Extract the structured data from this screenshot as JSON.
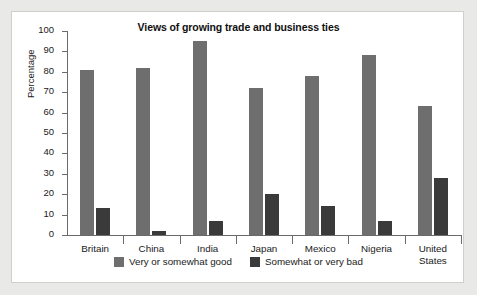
{
  "chart_data": {
    "type": "bar",
    "title": "Views of growing trade and business ties",
    "xlabel": "",
    "ylabel": "Percentage",
    "ylim": [
      0,
      100
    ],
    "yticks": [
      0,
      10,
      20,
      30,
      40,
      50,
      60,
      70,
      80,
      90,
      100
    ],
    "grid": false,
    "legend_position": "bottom",
    "categories": [
      "Britain",
      "China",
      "India",
      "Japan",
      "Mexico",
      "Nigeria",
      "United\nStates"
    ],
    "series": [
      {
        "name": "Very or somewhat good",
        "color": "#6e6e6e",
        "values": [
          81,
          82,
          95,
          72,
          78,
          88,
          63
        ]
      },
      {
        "name": "Somewhat or very bad",
        "color": "#3a3a3a",
        "values": [
          13,
          2,
          7,
          20,
          14,
          7,
          28
        ]
      }
    ]
  },
  "legend": {
    "items": [
      {
        "label": "Very or somewhat good",
        "swatch": "good"
      },
      {
        "label": "Somewhat or very bad",
        "swatch": "bad"
      }
    ]
  },
  "colors": {
    "page_background": "#e9e9e7",
    "panel_background": "#ffffff",
    "panel_border": "#cfcfcd",
    "axis": "#6b6b6b",
    "series_good": "#6e6e6e",
    "series_bad": "#3a3a3a",
    "text": "#1a1a1a"
  }
}
